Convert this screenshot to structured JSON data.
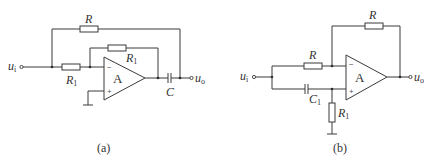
{
  "figure": {
    "panels": [
      {
        "id": "a",
        "caption": "(a)",
        "opamp": {
          "label": "A",
          "inverting_sign": "−",
          "noninverting_sign": "+"
        },
        "input": {
          "symbol": "u",
          "subscript": "i"
        },
        "output": {
          "symbol": "u",
          "subscript": "o"
        },
        "components": [
          {
            "type": "resistor",
            "label": "R",
            "subscript": "",
            "role": "outer feedback from input node to output node"
          },
          {
            "type": "resistor",
            "label": "R",
            "subscript": "1",
            "role": "input resistor to inverting input"
          },
          {
            "type": "resistor",
            "label": "R",
            "subscript": "1",
            "role": "feedback from op-amp output to inverting input"
          },
          {
            "type": "capacitor",
            "label": "C",
            "subscript": "",
            "role": "series between op-amp output and u_o"
          },
          {
            "type": "ground",
            "label": "",
            "role": "non-inverting input to ground"
          }
        ]
      },
      {
        "id": "b",
        "caption": "(b)",
        "opamp": {
          "label": "A",
          "inverting_sign": "−",
          "noninverting_sign": "+"
        },
        "input": {
          "symbol": "u",
          "subscript": "i"
        },
        "output": {
          "symbol": "u",
          "subscript": "o"
        },
        "components": [
          {
            "type": "resistor",
            "label": "R",
            "subscript": "",
            "role": "input resistor to inverting input"
          },
          {
            "type": "resistor",
            "label": "R",
            "subscript": "",
            "role": "feedback from output to inverting input"
          },
          {
            "type": "capacitor",
            "label": "C",
            "subscript": "1",
            "role": "input to non-inverting input"
          },
          {
            "type": "resistor",
            "label": "R",
            "subscript": "1",
            "role": "non-inverting input to ground"
          },
          {
            "type": "ground",
            "label": "",
            "role": "bottom of R1"
          }
        ]
      }
    ]
  },
  "labels": {
    "a": {
      "R_top": "R",
      "R1_in_main": "R",
      "R1_in_sub": "1",
      "R1_fb_main": "R",
      "R1_fb_sub": "1",
      "C": "C",
      "opamp": "A",
      "minus": "−",
      "plus": "+",
      "ui_main": "u",
      "ui_sub": "i",
      "uo_main": "u",
      "uo_sub": "o",
      "caption": "(a)"
    },
    "b": {
      "R_top": "R",
      "R_in": "R",
      "C1_main": "C",
      "C1_sub": "1",
      "R1_main": "R",
      "R1_sub": "1",
      "opamp": "A",
      "minus": "−",
      "plus": "+",
      "ui_main": "u",
      "ui_sub": "i",
      "uo_main": "u",
      "uo_sub": "o",
      "caption": "(b)"
    }
  }
}
